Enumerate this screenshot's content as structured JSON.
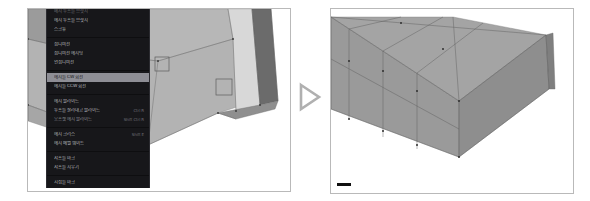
{
  "app": {
    "title": "Edge context menu comparison",
    "panel_count": 2
  },
  "left_panel": {
    "name": "before-viewport",
    "viewport_label": "3D mesh viewport with edge selection"
  },
  "right_panel": {
    "name": "after-viewport",
    "viewport_label": "3D mesh viewport after edge rotation"
  },
  "transition": {
    "icon": "play-triangle-icon",
    "color": "#a8a8a8"
  },
  "context_menu": {
    "title": "에지 컨텍스트 메뉴",
    "groups": [
      {
        "items": [
          {
            "label": "메지 루프를 브릿지",
            "shortcut": "",
            "state": "clipped"
          },
          {
            "label": "에지 루프를 브릿지",
            "shortcut": "",
            "state": "normal"
          },
          {
            "label": "스크류",
            "shortcut": "",
            "state": "normal"
          }
        ]
      },
      {
        "items": [
          {
            "label": "섭디비전",
            "shortcut": "",
            "state": "normal"
          },
          {
            "label": "섭디비전 에지링",
            "shortcut": "",
            "state": "normal"
          },
          {
            "label": "언섭디비전",
            "shortcut": "",
            "state": "normal"
          }
        ]
      },
      {
        "items": [
          {
            "label": "에지를 CW 회전",
            "shortcut": "",
            "state": "selected"
          },
          {
            "label": "에지를 CCW 회전",
            "shortcut": "",
            "state": "normal"
          }
        ]
      },
      {
        "items": [
          {
            "label": "에지 슬라이드",
            "shortcut": "",
            "state": "normal"
          },
          {
            "label": "루프를 잘라내고 슬라이드",
            "shortcut": "Ctrl R",
            "state": "normal"
          },
          {
            "label": "오프셋 에지 슬라이드",
            "shortcut": "Shift Ctrl R",
            "state": "dim"
          }
        ]
      },
      {
        "items": [
          {
            "label": "에지 크리스",
            "shortcut": "Shift E",
            "state": "normal"
          },
          {
            "label": "에지 베벨 웨이트",
            "shortcut": "",
            "state": "normal"
          }
        ]
      },
      {
        "items": [
          {
            "label": "샤프를 마크",
            "shortcut": "",
            "state": "normal"
          },
          {
            "label": "샤프를 지우기",
            "shortcut": "",
            "state": "normal"
          }
        ]
      },
      {
        "items": [
          {
            "label": "시접를 마크",
            "shortcut": "",
            "state": "normal"
          },
          {
            "label": "시접를 지우기",
            "shortcut": "",
            "state": "normal"
          },
          {
            "label": "버텍스에서 시접를 마크",
            "shortcut": "",
            "state": "normal"
          },
          {
            "label": "버텍스에서 시접를 지우기",
            "shortcut": "",
            "state": "clipped"
          }
        ]
      }
    ]
  }
}
